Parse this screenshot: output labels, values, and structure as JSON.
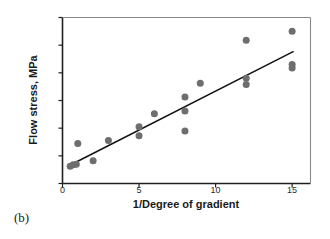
{
  "caption": "(b)",
  "chart_data": {
    "type": "scatter",
    "title": "",
    "xlabel": "1/Degree of gradient",
    "ylabel": "Flow stress, MPa",
    "xlim": [
      0,
      16.2
    ],
    "ylim": [
      514,
      526
    ],
    "xticks": [
      0,
      5,
      10,
      15
    ],
    "yticks": [
      514,
      516,
      518,
      520,
      522,
      524,
      526
    ],
    "grid": false,
    "legend": null,
    "marker": {
      "shape": "circle",
      "color": "#6e6e6e",
      "size_px": 7
    },
    "trendline": {
      "type": "linear-fit",
      "color": "#111111",
      "x_start": 0.45,
      "x_end": 15.1,
      "y_start": 515.3,
      "y_end": 523.55
    },
    "points": [
      {
        "x": 0.5,
        "y": 515.25
      },
      {
        "x": 0.7,
        "y": 515.35
      },
      {
        "x": 0.9,
        "y": 515.4
      },
      {
        "x": 1.0,
        "y": 516.9
      },
      {
        "x": 2.0,
        "y": 515.65
      },
      {
        "x": 3.0,
        "y": 517.1
      },
      {
        "x": 5.0,
        "y": 518.1
      },
      {
        "x": 5.0,
        "y": 517.45
      },
      {
        "x": 6.0,
        "y": 519.05
      },
      {
        "x": 8.0,
        "y": 520.25
      },
      {
        "x": 8.0,
        "y": 519.25
      },
      {
        "x": 8.0,
        "y": 517.8
      },
      {
        "x": 9.0,
        "y": 521.25
      },
      {
        "x": 12.0,
        "y": 524.35
      },
      {
        "x": 12.0,
        "y": 521.6
      },
      {
        "x": 12.0,
        "y": 521.15
      },
      {
        "x": 15.0,
        "y": 525.0
      },
      {
        "x": 15.0,
        "y": 522.6
      },
      {
        "x": 15.0,
        "y": 522.35
      }
    ]
  },
  "axes": {
    "frame_color": "#4d4d4d",
    "tick_color": "#4d4d4d"
  }
}
